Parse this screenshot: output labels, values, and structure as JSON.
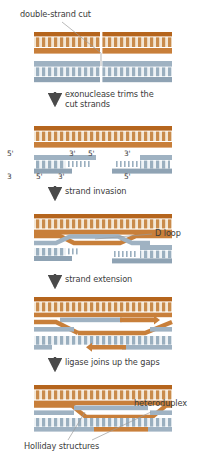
{
  "figure": {
    "type": "diagram"
  },
  "colors": {
    "orange_dark": "#b5651d",
    "orange_mid": "#c87f3a",
    "orange_light": "#e8c9a0",
    "orange_rung": "#c98b4b",
    "blue_dark": "#8fa3b4",
    "blue_mid": "#9fb2c2",
    "blue_light": "#c3d0da",
    "blue_rung": "#9aafbf",
    "text": "#3c3c3c",
    "leader": "#9b9b9b",
    "arrow": "#4a4a4a",
    "background": "#ffffff"
  },
  "annotations": {
    "double_strand_cut": "double-strand cut",
    "d_loop": "D loop",
    "heteroduplex": "heteroduplex",
    "holliday_structures": "Holliday structures"
  },
  "steps": [
    {
      "id": "step-exonuclease",
      "label": "exonuclease trims the cut strands",
      "line1": "exonuclease trims the",
      "line2": "cut strands"
    },
    {
      "id": "step-strand-invasion",
      "label": "strand invasion",
      "line1": "strand invasion",
      "line2": ""
    },
    {
      "id": "step-strand-extension",
      "label": "strand extension",
      "line1": "strand extension",
      "line2": ""
    },
    {
      "id": "step-ligase",
      "label": "ligase joins up the gaps",
      "line1": "ligase joins up the gaps",
      "line2": ""
    }
  ],
  "polarity_labels": {
    "panel2": [
      {
        "id": "p2-left-top-5",
        "text": "5'"
      },
      {
        "id": "p2-left-top-3",
        "text": "3'"
      },
      {
        "id": "p2-right-top-5",
        "text": "5'"
      },
      {
        "id": "p2-right-top-3",
        "text": "3'"
      },
      {
        "id": "p2-left-bot-3",
        "text": "3"
      },
      {
        "id": "p2-left-bot-5",
        "text": "5'"
      },
      {
        "id": "p2-right-bot-3",
        "text": "3'"
      },
      {
        "id": "p2-right-bot-5",
        "text": "5'"
      }
    ]
  },
  "panels": [
    {
      "id": "panel-1",
      "name": "duplexes-with-cut",
      "description": "orange duplex above, blue duplex below, both cut in the middle"
    },
    {
      "id": "panel-2",
      "name": "resected-strands",
      "description": "intact orange duplex; blue duplex resected into 3' single-strand tails"
    },
    {
      "id": "panel-3",
      "name": "strand-invasion-d-loop",
      "description": "blue strand invades orange duplex forming D loop"
    },
    {
      "id": "panel-4",
      "name": "strand-extension",
      "description": "new synthesis arrows extend invading strands"
    },
    {
      "id": "panel-5",
      "name": "holliday-junctions",
      "description": "ligated heteroduplex with two Holliday junctions"
    }
  ]
}
